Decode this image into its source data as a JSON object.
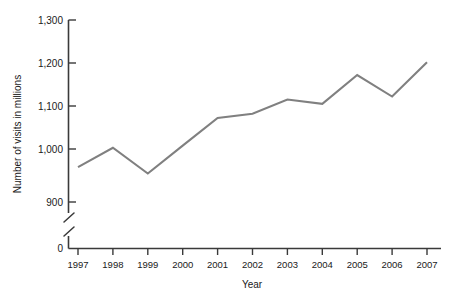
{
  "chart_data": {
    "type": "line",
    "title": "",
    "subtitle": "",
    "xlabel": "Year",
    "ylabel": "Number of visits in millions",
    "categories": [
      "1997",
      "1998",
      "1999",
      "2000",
      "2001",
      "2002",
      "2003",
      "2004",
      "2005",
      "2006",
      "2007"
    ],
    "x": [
      1997,
      1998,
      1999,
      2000,
      2001,
      2002,
      2003,
      2004,
      2005,
      2006,
      2007
    ],
    "values": [
      958,
      1003,
      943,
      1008,
      1072,
      1082,
      1115,
      1105,
      1172,
      1122,
      1202
    ],
    "series": [
      {
        "name": "Number of visits in millions",
        "values": [
          958,
          1003,
          943,
          1008,
          1072,
          1082,
          1115,
          1105,
          1172,
          1122,
          1202
        ]
      }
    ],
    "ylim": [
      900,
      1300
    ],
    "y_ticks": [
      900,
      1000,
      1100,
      1200,
      1300
    ],
    "y_tick_labels": [
      "900",
      "1,000",
      "1,100",
      "1,200",
      "1,300"
    ],
    "y_axis_origin_label": "0",
    "y_axis_broken": true,
    "grid": false,
    "legend": false,
    "legend_position": "none",
    "line_color": "#808080",
    "axis_color": "#3a3a3a",
    "background_color": "#ffffff"
  },
  "axis": {
    "y_title": "Number of visits in millions",
    "x_title": "Year",
    "zero_label": "0",
    "y_labels": {
      "t1300": "1,300",
      "t1200": "1,200",
      "t1100": "1,100",
      "t1000": "1,000",
      "t900": "900"
    },
    "x_labels": {
      "y1997": "1997",
      "y1998": "1998",
      "y1999": "1999",
      "y2000": "2000",
      "y2001": "2001",
      "y2002": "2002",
      "y2003": "2003",
      "y2004": "2004",
      "y2005": "2005",
      "y2006": "2006",
      "y2007": "2007"
    }
  }
}
